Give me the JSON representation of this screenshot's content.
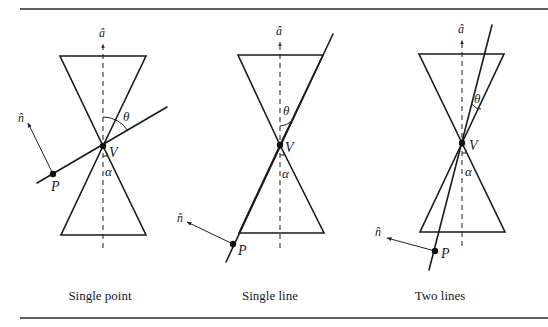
{
  "figure": {
    "top_rule": {
      "x1": 20,
      "x2": 548,
      "y": 9
    },
    "bottom_rule": {
      "x1": 20,
      "x2": 548,
      "y": 318
    },
    "panels": [
      {
        "id": "single-point",
        "caption": "Single point",
        "caption_pos": [
          100,
          300
        ],
        "axis": {
          "x": 103,
          "y1": 40,
          "y2": 248,
          "label": "â",
          "label_pos": [
            99,
            37
          ]
        },
        "top_triangle": [
          [
            60,
            56
          ],
          [
            146,
            56
          ],
          [
            103,
            146
          ]
        ],
        "bottom_triangle": [
          [
            61,
            235
          ],
          [
            146,
            235
          ],
          [
            103,
            146
          ]
        ],
        "vertex": {
          "pos": [
            103,
            146
          ],
          "label": "V",
          "label_pos": [
            109,
            157
          ]
        },
        "lines": [
          [
            [
              37,
              183
            ],
            [
              167,
              107
            ]
          ]
        ],
        "point": {
          "pos": [
            53,
            174
          ],
          "label": "P",
          "label_pos": [
            51,
            191
          ]
        },
        "normal": {
          "from": [
            53,
            174
          ],
          "to": [
            28,
            123
          ],
          "label": "n̂",
          "label_pos": [
            18,
            122
          ]
        },
        "theta": {
          "arc": "M103,117 A29,29 0 0,1 128,131",
          "label": "θ",
          "label_pos": [
            123,
            121
          ]
        },
        "alpha": {
          "tick": "M103,156 L107,156 L107,153",
          "label": "α",
          "label_pos": [
            105,
            176
          ]
        }
      },
      {
        "id": "single-line",
        "caption": "Single line",
        "caption_pos": [
          270,
          300
        ],
        "axis": {
          "x": 280,
          "y1": 38,
          "y2": 248,
          "label": "â",
          "label_pos": [
            276,
            35
          ]
        },
        "top_triangle": [
          [
            238,
            55
          ],
          [
            323,
            55
          ],
          [
            280,
            145
          ]
        ],
        "bottom_triangle": [
          [
            239,
            233
          ],
          [
            324,
            233
          ],
          [
            280,
            145
          ]
        ],
        "vertex": {
          "pos": [
            280,
            145
          ],
          "label": "V",
          "label_pos": [
            285,
            152
          ]
        },
        "lines": [
          [
            [
              226,
              262
            ],
            [
              333,
              34
            ]
          ]
        ],
        "point": {
          "pos": [
            233,
            244
          ],
          "label": "P",
          "label_pos": [
            238,
            255
          ]
        },
        "normal": {
          "from": [
            233,
            244
          ],
          "to": [
            187,
            222
          ],
          "label": "n̂",
          "label_pos": [
            177,
            222
          ]
        },
        "theta": {
          "arc": "M280,126 A19,19 0 0,0 292,121",
          "label": "θ",
          "label_pos": [
            283,
            115
          ]
        },
        "alpha": {
          "tick": "M280,155 L284,155 L284,152",
          "label": "α",
          "label_pos": [
            282,
            178
          ]
        }
      },
      {
        "id": "two-lines",
        "caption": "Two lines",
        "caption_pos": [
          440,
          300
        ],
        "axis": {
          "x": 462,
          "y1": 36,
          "y2": 246,
          "label": "â",
          "label_pos": [
            458,
            33
          ]
        },
        "top_triangle": [
          [
            419,
            54
          ],
          [
            504,
            54
          ],
          [
            462,
            143
          ]
        ],
        "bottom_triangle": [
          [
            420,
            232
          ],
          [
            505,
            232
          ],
          [
            462,
            143
          ]
        ],
        "vertex": {
          "pos": [
            462,
            143
          ],
          "label": "V",
          "label_pos": [
            469,
            150
          ]
        },
        "lines": [
          [
            [
              429,
              270
            ],
            [
              492,
              25
            ]
          ]
        ],
        "point": {
          "pos": [
            435,
            251
          ],
          "label": "P",
          "label_pos": [
            441,
            258
          ]
        },
        "normal": {
          "from": [
            435,
            251
          ],
          "to": [
            387,
            238
          ],
          "label": "n̂",
          "label_pos": [
            375,
            236
          ]
        },
        "theta": {
          "arc": "M472,104 A11,11 0 0,0 481,109",
          "label": "θ",
          "label_pos": [
            474,
            103
          ]
        },
        "alpha": {
          "tick": "M462,153 L466,153 L466,150",
          "label": "α",
          "label_pos": [
            465,
            176
          ]
        }
      }
    ]
  }
}
